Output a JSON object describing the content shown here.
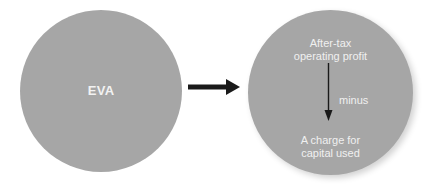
{
  "diagram": {
    "left_circle": {
      "label": "EVA",
      "fill": "#a6a6a6"
    },
    "connector_arrow": {
      "direction": "right",
      "color": "#1a1a1a"
    },
    "right_circle": {
      "fill": "#a6a6a6",
      "top_text_line1": "After-tax",
      "top_text_line2": "operating profit",
      "operator_label": "minus",
      "bottom_text_line1": "A charge for",
      "bottom_text_line2": "capital used",
      "inner_arrow": {
        "direction": "down",
        "color": "#1a1a1a"
      }
    }
  }
}
